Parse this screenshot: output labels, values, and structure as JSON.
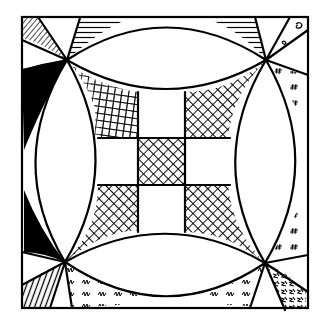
{
  "artwork": {
    "subject": "Hand-drawn quilt block: nine-patch center inside four curved arcs (Robbing Peter to Pay Paul / orange-peel style)",
    "colors": {
      "ink": "#000000",
      "paper": "#ffffff"
    },
    "frame": {
      "x": 22,
      "y": 17,
      "width": 286,
      "height": 291
    },
    "pinch_points": {
      "top_left": [
        67,
        60
      ],
      "top_right": [
        266,
        60
      ],
      "bottom_left": [
        65,
        262
      ],
      "bottom_right": [
        265,
        263
      ]
    },
    "nine_patch": {
      "grid_x": [
        95,
        138,
        185,
        228
      ],
      "grid_y": [
        95,
        138,
        185,
        228
      ],
      "cells": [
        [
          "grid-hatch",
          "blank",
          "crosshatch"
        ],
        [
          "blank",
          "crosshatch",
          "blank"
        ],
        [
          "crosshatch",
          "blank",
          "crosshatch"
        ]
      ]
    },
    "corner_fills": {
      "top_left": [
        "diagonal-hatch",
        "solid-black"
      ],
      "top_right": [
        "horizontal-lines",
        "dotted-motif",
        "hash-marks"
      ],
      "bottom_left": [
        "solid-black",
        "vertical-lines",
        "wave-scribbles"
      ],
      "bottom_right": [
        "hash-marks",
        "scribble-dense",
        "scribble-z"
      ]
    }
  }
}
